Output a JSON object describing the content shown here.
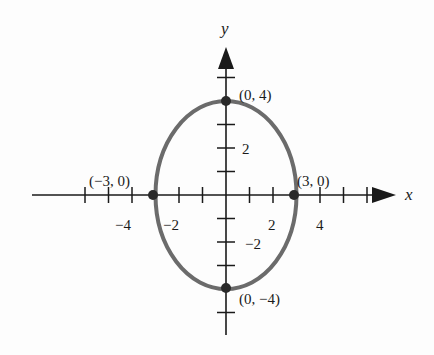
{
  "diagram": {
    "type": "ellipse-graph",
    "equation_implied": "x^2/9 + y^2/16 = 1",
    "axes": {
      "x_label": "x",
      "y_label": "y",
      "x_ticks": [
        -6,
        -5,
        -4,
        -3,
        -2,
        -1,
        1,
        2,
        3,
        4,
        5,
        6
      ],
      "y_ticks": [
        -5,
        -4,
        -3,
        -2,
        -1,
        1,
        2,
        3,
        4,
        5
      ],
      "x_tick_labels": [
        {
          "value": -4,
          "text": "−4"
        },
        {
          "value": -2,
          "text": "−2"
        },
        {
          "value": 2,
          "text": "2"
        },
        {
          "value": 4,
          "text": "4"
        }
      ],
      "y_tick_labels": [
        {
          "value": 2,
          "text": "2"
        },
        {
          "value": -2,
          "text": "−2"
        }
      ]
    },
    "ellipse": {
      "center": [
        0,
        0
      ],
      "semi_axis_x": 3,
      "semi_axis_y": 4,
      "stroke_color": "#6b6b6b"
    },
    "points": [
      {
        "x": 0,
        "y": 4,
        "label": "(0, 4)"
      },
      {
        "x": -3,
        "y": 0,
        "label": "(−3, 0)"
      },
      {
        "x": 3,
        "y": 0,
        "label": "(3, 0)"
      },
      {
        "x": 0,
        "y": -4,
        "label": "(0, −4)"
      }
    ],
    "colors": {
      "axis": "#1a1a1a",
      "curve": "#6b6b6b",
      "point": "#2a2a2a",
      "background": "#fdfdfd"
    }
  }
}
